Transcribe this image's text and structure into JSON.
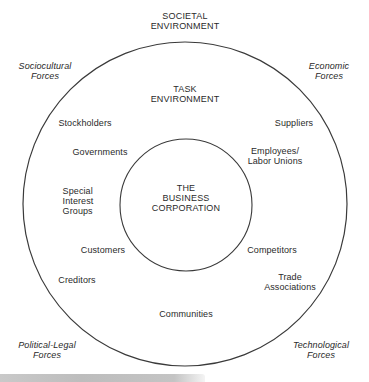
{
  "diagram": {
    "title_lines": [
      "SOCIETAL",
      "ENVIRONMENT"
    ],
    "outer_ring": {
      "cx": 185,
      "cy": 204,
      "r": 162,
      "stroke": "#3a3a3a"
    },
    "inner_ring": {
      "cx": 186,
      "cy": 205,
      "r": 66,
      "stroke": "#3a3a3a"
    },
    "societal_forces": [
      {
        "id": "sociocultural",
        "lines": [
          "Sociocultural",
          "Forces"
        ]
      },
      {
        "id": "economic",
        "lines": [
          "Economic",
          "Forces"
        ]
      },
      {
        "id": "political-legal",
        "lines": [
          "Political-Legal",
          "Forces"
        ]
      },
      {
        "id": "technological",
        "lines": [
          "Technological",
          "Forces"
        ]
      }
    ],
    "task_environment": {
      "title_lines": [
        "TASK",
        "ENVIRONMENT"
      ],
      "stakeholders": [
        {
          "id": "stockholders",
          "lines": [
            "Stockholders"
          ]
        },
        {
          "id": "suppliers",
          "lines": [
            "Suppliers"
          ]
        },
        {
          "id": "governments",
          "lines": [
            "Governments"
          ]
        },
        {
          "id": "employees",
          "lines": [
            "Employees/",
            "Labor Unions"
          ]
        },
        {
          "id": "special-interest",
          "lines": [
            "Special",
            "Interest",
            "Groups"
          ]
        },
        {
          "id": "customers",
          "lines": [
            "Customers"
          ]
        },
        {
          "id": "competitors",
          "lines": [
            "Competitors"
          ]
        },
        {
          "id": "creditors",
          "lines": [
            "Creditors"
          ]
        },
        {
          "id": "trade-associations",
          "lines": [
            "Trade",
            "Associations"
          ]
        },
        {
          "id": "communities",
          "lines": [
            "Communities"
          ]
        }
      ]
    },
    "core": {
      "lines": [
        "THE",
        "BUSINESS",
        "CORPORATION"
      ]
    }
  }
}
